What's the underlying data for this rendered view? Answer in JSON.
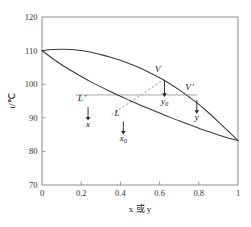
{
  "chart_data": {
    "type": "line",
    "title": "",
    "subtitle": "",
    "xlabel": "x 或 y",
    "ylabel": "t/℃",
    "xlim": [
      0,
      1
    ],
    "ylim": [
      70,
      120
    ],
    "grid": false,
    "legend": "none",
    "xticks": [
      "0",
      "0.2",
      "0.4",
      "0.6",
      "0.8",
      "1"
    ],
    "xtick_values": [
      0,
      0.2,
      0.4,
      0.6,
      0.8,
      1
    ],
    "yticks": [
      "70",
      "80",
      "90",
      "100",
      "110",
      "120"
    ],
    "ytick_values": [
      70,
      80,
      90,
      100,
      110,
      120
    ],
    "series": [
      {
        "name": "vapor curve (dew point line)",
        "style": "solid",
        "points": [
          [
            0.0,
            110.0
          ],
          [
            0.05,
            110.3
          ],
          [
            0.1,
            110.4
          ],
          [
            0.15,
            110.3
          ],
          [
            0.2,
            110.0
          ],
          [
            0.25,
            109.5
          ],
          [
            0.3,
            108.8
          ],
          [
            0.35,
            108.0
          ],
          [
            0.4,
            107.1
          ],
          [
            0.45,
            106.0
          ],
          [
            0.5,
            104.8
          ],
          [
            0.55,
            103.4
          ],
          [
            0.6,
            101.9
          ],
          [
            0.65,
            100.2
          ],
          [
            0.7,
            98.3
          ],
          [
            0.75,
            96.2
          ],
          [
            0.8,
            94.0
          ],
          [
            0.85,
            91.5
          ],
          [
            0.9,
            88.8
          ],
          [
            0.95,
            86.0
          ],
          [
            1.0,
            83.2
          ]
        ]
      },
      {
        "name": "liquid curve (bubble point line)",
        "style": "solid",
        "points": [
          [
            0.0,
            110.0
          ],
          [
            0.05,
            107.8
          ],
          [
            0.1,
            105.8
          ],
          [
            0.15,
            104.0
          ],
          [
            0.2,
            102.3
          ],
          [
            0.25,
            100.7
          ],
          [
            0.3,
            99.2
          ],
          [
            0.35,
            97.8
          ],
          [
            0.4,
            96.4
          ],
          [
            0.45,
            95.1
          ],
          [
            0.5,
            93.8
          ],
          [
            0.55,
            92.6
          ],
          [
            0.6,
            91.4
          ],
          [
            0.65,
            90.2
          ],
          [
            0.7,
            89.1
          ],
          [
            0.75,
            88.0
          ],
          [
            0.8,
            86.9
          ],
          [
            0.85,
            85.9
          ],
          [
            0.9,
            84.9
          ],
          [
            0.95,
            84.0
          ],
          [
            1.0,
            83.2
          ]
        ]
      }
    ],
    "tie_line": {
      "name": "horizontal tie line",
      "temperature": 96.8,
      "x_start": 0.17,
      "x_end": 0.79,
      "style": "solid-thin"
    },
    "dashed_line": {
      "name": "operating / rectification diagonal",
      "style": "dashed",
      "from": [
        0.355,
        91.0
      ],
      "to": [
        0.625,
        101.5
      ]
    },
    "annotations": [
      {
        "id": "L-prime",
        "label": "L",
        "prime": true,
        "label_x": 0.225,
        "label_y": 95.0,
        "arrow_x": 0.235,
        "arrow_top": 93.2,
        "arrow_bottom": 89.2,
        "value_label": "x",
        "value_sub": "",
        "value_x": 0.235,
        "value_y": 87.4
      },
      {
        "id": "L",
        "label": "L",
        "prime": false,
        "label_x": 0.395,
        "label_y": 90.5,
        "arrow_x": 0.415,
        "arrow_top": 88.9,
        "arrow_bottom": 85.0,
        "value_label": "x",
        "value_sub": "0",
        "value_x": 0.415,
        "value_y": 83.0
      },
      {
        "id": "V",
        "label": "V",
        "prime": false,
        "label_x": 0.605,
        "label_y": 103.6,
        "arrow_x": 0.625,
        "arrow_top": 101.2,
        "arrow_bottom": 96.2,
        "value_label": "y",
        "value_sub": "0",
        "value_x": 0.625,
        "value_y": 94.2
      },
      {
        "id": "V-prime",
        "label": "V",
        "prime": true,
        "label_x": 0.775,
        "label_y": 98.2,
        "arrow_x": 0.79,
        "arrow_top": 95.3,
        "arrow_bottom": 91.2,
        "value_label": "y",
        "value_sub": "",
        "value_x": 0.79,
        "value_y": 89.2
      }
    ],
    "colors": {
      "curve": "#3a3a3a",
      "tie_line": "#9a9a9a",
      "dashed_line": "#b5b5b5",
      "axis": "#8d8d8d",
      "text": "#1a1a1a",
      "background": "#ffffff"
    }
  }
}
